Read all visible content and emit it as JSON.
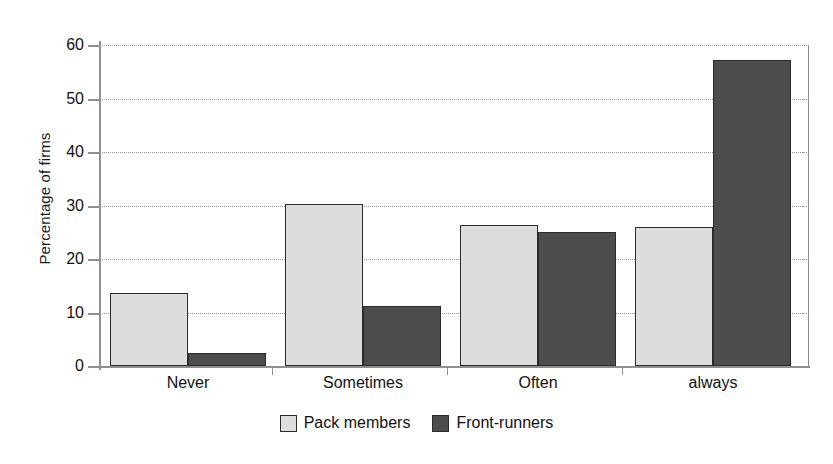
{
  "chart_data": {
    "type": "bar",
    "title": "",
    "xlabel": "",
    "ylabel": "Percentage of firms",
    "ylim": [
      0,
      60
    ],
    "ytick_step": 10,
    "yticks": [
      0,
      10,
      20,
      30,
      40,
      50,
      60
    ],
    "ytick_labels": [
      "0",
      "10",
      "20",
      "30",
      "40",
      "50",
      "60"
    ],
    "grid": true,
    "grid_style": "dotted-horizontal",
    "legend_position": "bottom-center",
    "categories": [
      "Never",
      "Sometimes",
      "Often",
      "always"
    ],
    "series": [
      {
        "name": "Pack members",
        "color": "#dddddd",
        "edge_color": "#2b2b2b",
        "values": [
          13.6,
          30.2,
          26.3,
          25.9
        ]
      },
      {
        "name": "Front-runners",
        "color": "#4d4d4d",
        "edge_color": "#2b2b2b",
        "values": [
          2.5,
          11.3,
          25.0,
          57.2
        ]
      }
    ]
  },
  "legend": {
    "items": [
      {
        "label": "Pack members",
        "swatch": "light-gray-square"
      },
      {
        "label": "Front-runners",
        "swatch": "dark-gray-square"
      }
    ]
  },
  "colors": {
    "pack_members": "#dddddd",
    "front_runners": "#4d4d4d",
    "axis": "#8f8f8f",
    "gridline": "#9a9a9a",
    "bar_edge": "#2b2b2b",
    "background": "#ffffff"
  }
}
